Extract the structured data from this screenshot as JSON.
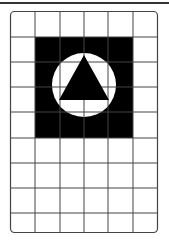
{
  "figure": {
    "grid": {
      "columns": 6,
      "rows": 9
    },
    "colors": {
      "line": "#444444",
      "fill_dark": "#000000",
      "fill_light": "#ffffff",
      "rule": "#333333"
    },
    "shapes": [
      "square",
      "circle",
      "triangle"
    ]
  }
}
